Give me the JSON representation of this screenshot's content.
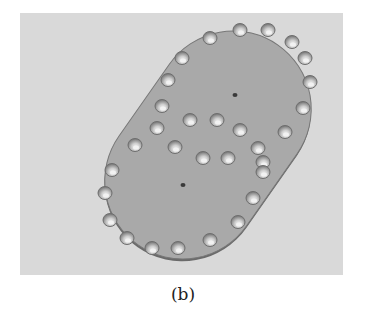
{
  "figure": {
    "caption": "(b)",
    "colors": {
      "background": "#d9d9d9",
      "plate_fill": "#a8a8a8",
      "plate_edge": "#6a6a6a",
      "hole_fill": "#8c8c8c",
      "hole_highlight": "#f2f2f2",
      "marker": "#3a3a3a"
    },
    "outer_holes": [
      [
        190,
        25
      ],
      [
        220,
        17
      ],
      [
        248,
        17
      ],
      [
        272,
        29
      ],
      [
        285,
        45
      ],
      [
        290,
        69
      ],
      [
        283,
        95
      ],
      [
        265,
        119
      ],
      [
        243,
        149
      ],
      [
        233,
        185
      ],
      [
        218,
        209
      ],
      [
        190,
        227
      ],
      [
        158,
        235
      ],
      [
        132,
        235
      ],
      [
        107,
        225
      ],
      [
        90,
        207
      ],
      [
        85,
        180
      ],
      [
        92,
        157
      ],
      [
        115,
        132
      ],
      [
        137,
        115
      ],
      [
        142,
        93
      ],
      [
        148,
        67
      ],
      [
        162,
        45
      ]
    ],
    "inner_holes": [
      [
        170,
        107
      ],
      [
        197,
        107
      ],
      [
        220,
        117
      ],
      [
        155,
        134
      ],
      [
        183,
        145
      ],
      [
        208,
        145
      ],
      [
        238,
        135
      ],
      [
        243,
        159
      ]
    ],
    "markers": [
      [
        215,
        82
      ],
      [
        163,
        172
      ]
    ]
  }
}
